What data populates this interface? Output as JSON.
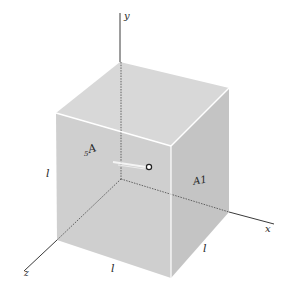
{
  "figure": {
    "axes": {
      "x_label": "x",
      "y_label": "y",
      "z_label": "z"
    },
    "edge_labels": {
      "left": "l",
      "bottom": "l",
      "right": "l"
    },
    "face_labels": {
      "right_face": "A1",
      "front_face_main": "A",
      "front_face_sub": "5"
    },
    "colors": {
      "cube_top": "#d6d6d6",
      "cube_front": "#cfcfcf",
      "cube_right": "#c6c6c6",
      "edge_highlight": "#ffffff",
      "axis": "#3a3a3a"
    }
  }
}
